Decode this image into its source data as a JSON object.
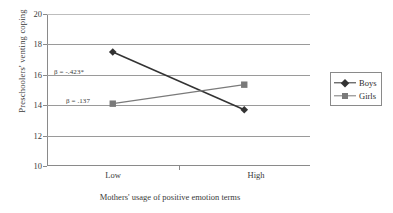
{
  "chart_data": {
    "type": "line",
    "title": "",
    "xlabel": "Mothers' usage of positive emotion terms",
    "ylabel": "Preschoolers' venting coping",
    "categories": [
      "Low",
      "High"
    ],
    "ylim": [
      10,
      20
    ],
    "yticks": [
      10,
      12,
      14,
      16,
      18,
      20
    ],
    "grid": true,
    "legend_position": "right-outside",
    "series": [
      {
        "name": "Boys",
        "values": [
          17.5,
          13.7
        ],
        "marker": "diamond",
        "color": "#333333"
      },
      {
        "name": "Girls",
        "values": [
          14.1,
          15.35
        ],
        "marker": "square",
        "color": "#7a7a7a"
      }
    ],
    "annotations": [
      {
        "text": "β = -.423*",
        "series": "Boys"
      },
      {
        "text": "β = .137",
        "series": "Girls"
      }
    ]
  },
  "axis": {
    "y_tick_labels": [
      "20",
      "18",
      "16",
      "14",
      "12",
      "10"
    ],
    "x_tick_labels": [
      "Low",
      "High"
    ]
  },
  "legend": {
    "items": [
      {
        "label": "Boys"
      },
      {
        "label": "Girls"
      }
    ]
  }
}
